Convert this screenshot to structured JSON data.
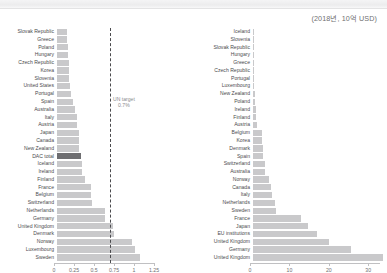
{
  "header": {
    "unit_note": "(2018년, 10억 USD)"
  },
  "chart_data": [
    {
      "type": "bar",
      "orientation": "horizontal",
      "panel": "left",
      "title": "",
      "xlabel": "",
      "ylabel": "",
      "xlim": [
        0,
        1.25
      ],
      "xticks": [
        "0",
        "0.25",
        "0.5",
        "0.75",
        "1",
        "1.25"
      ],
      "xtick_values": [
        0,
        0.25,
        0.5,
        0.75,
        1,
        1.25
      ],
      "grid": false,
      "annotation": {
        "label_line1": "UN target",
        "label_line2": "0.7%",
        "value": 0.7
      },
      "highlight_category": "DAC total",
      "highlight_color": "#6e6e71",
      "bar_color": "#c9c9cb",
      "categories": [
        "Slovak Republic",
        "Greece",
        "Poland",
        "Hungary",
        "Czech Republic",
        "Korea",
        "Slovenia",
        "United States",
        "Portugal",
        "Spain",
        "Australia",
        "Italy",
        "Austria",
        "Japan",
        "Canada",
        "New Zealand",
        "DAC total",
        "Iceland",
        "Ireland",
        "Finland",
        "France",
        "Belgium",
        "Switzerland",
        "Netherlands",
        "Germany",
        "United Kingdom",
        "Denmark",
        "Norway",
        "Luxembourg",
        "Sweden"
      ],
      "values": [
        0.13,
        0.13,
        0.14,
        0.14,
        0.15,
        0.15,
        0.16,
        0.17,
        0.18,
        0.2,
        0.23,
        0.25,
        0.26,
        0.28,
        0.28,
        0.28,
        0.31,
        0.32,
        0.32,
        0.36,
        0.43,
        0.43,
        0.44,
        0.61,
        0.61,
        0.7,
        0.72,
        0.94,
        0.98,
        1.04
      ]
    },
    {
      "type": "bar",
      "orientation": "horizontal",
      "panel": "right",
      "title": "",
      "xlabel": "",
      "ylabel": "",
      "xlim": [
        0,
        33
      ],
      "xticks": [
        "0",
        "10",
        "20",
        "30"
      ],
      "xtick_values": [
        0,
        10,
        20,
        30
      ],
      "grid": false,
      "bar_color": "#c9c9cb",
      "categories": [
        "Iceland",
        "Slovenia",
        "Slovak Republic",
        "Hungary",
        "Greece",
        "Czech Republic",
        "Portugal",
        "Luxembourg",
        "New Zealand",
        "Poland",
        "Ireland",
        "Finland",
        "Austria",
        "Belgium",
        "Korea",
        "Denmark",
        "Spain",
        "Switzerland",
        "Australia",
        "Norway",
        "Canada",
        "Italy",
        "Netherlands",
        "Sweden",
        "France",
        "Japan",
        "EU institutions",
        "United Kingdom",
        "Germany",
        "United Kingdom"
      ],
      "values": [
        0.07,
        0.08,
        0.13,
        0.29,
        0.29,
        0.3,
        0.38,
        0.45,
        0.55,
        0.76,
        0.93,
        0.98,
        1.17,
        2.3,
        2.35,
        2.58,
        2.65,
        3.1,
        3.15,
        4.26,
        4.73,
        4.94,
        5.62,
        5.84,
        12.21,
        14.16,
        16.48,
        19.41,
        24.98,
        33.2
      ]
    }
  ]
}
